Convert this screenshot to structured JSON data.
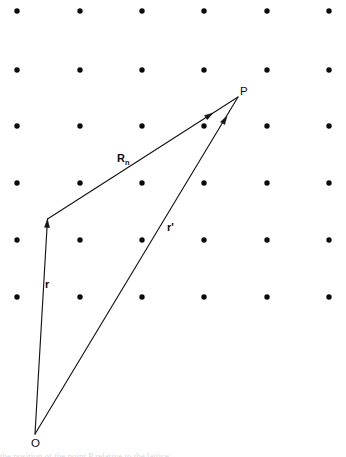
{
  "figure": {
    "background_color": "#ffffff",
    "ink_color": "#141414",
    "width": 346,
    "height": 457
  },
  "lattice": {
    "dot_color": "#0b0b0b",
    "dot_radius": 2.7,
    "columns_x": [
      17,
      80,
      142,
      204,
      267,
      329
    ],
    "rows_y": [
      11,
      70,
      126,
      183,
      240,
      297
    ],
    "column_spacing": 62.4,
    "row_spacing": 57.2,
    "dot_count": 36
  },
  "points": [
    {
      "id": "origin",
      "label": "O",
      "x": 35,
      "y": 434,
      "label_x": 31,
      "label_y": 447
    },
    {
      "id": "field-point",
      "label": "P",
      "x": 238,
      "y": 97,
      "label_x": 240,
      "label_y": 95
    }
  ],
  "vectors": [
    {
      "id": "r",
      "label": "r",
      "subscript": "",
      "from": {
        "x": 35,
        "y": 434
      },
      "to": {
        "x": 47.5,
        "y": 219
      },
      "arrow_at": {
        "x": 47.5,
        "y": 219
      },
      "label_x": 45,
      "label_y": 288,
      "description": "lattice vector from origin O to lattice point"
    },
    {
      "id": "Rn",
      "label": "R",
      "subscript": "n",
      "from": {
        "x": 47.5,
        "y": 219
      },
      "to": {
        "x": 238,
        "y": 97
      },
      "arrow_at": {
        "x": 213,
        "y": 113
      },
      "label_x": 117,
      "label_y": 162,
      "description": "vector from lattice point to field point P"
    },
    {
      "id": "rprime",
      "label": "r'",
      "subscript": "",
      "from": {
        "x": 35,
        "y": 434
      },
      "to": {
        "x": 238,
        "y": 97
      },
      "arrow_at": {
        "x": 227,
        "y": 116
      },
      "label_x": 167,
      "label_y": 231,
      "description": "vector from origin O to field point P"
    }
  ],
  "caption": {
    "cut_off_text": "the position of the point P relative to the lattice"
  }
}
